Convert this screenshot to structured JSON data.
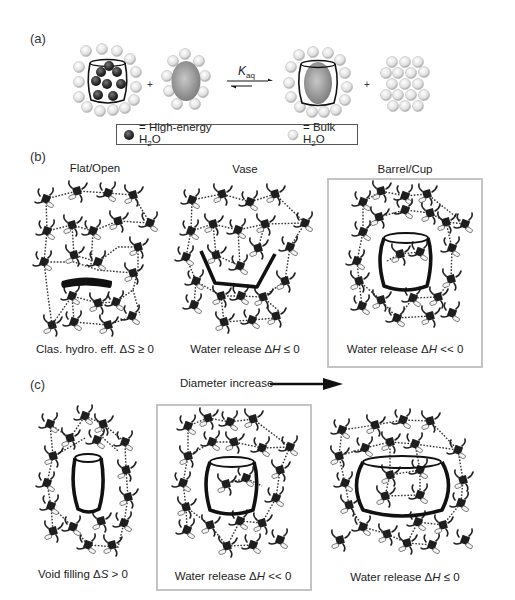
{
  "panels": {
    "a": {
      "label": "(a)",
      "equilibrium_label": "K",
      "equilibrium_sub": "aq",
      "plus_1": "+",
      "plus_2": "+",
      "legend": {
        "high_energy_prefix": "= High-energy H",
        "high_energy_sub": "2",
        "high_energy_suffix": "O",
        "bulk_prefix": "= Bulk H",
        "bulk_sub": "2",
        "bulk_suffix": "O"
      }
    },
    "b": {
      "label": "(b)",
      "items": [
        {
          "title": "Flat/Open",
          "caption_prefix": "Clas. hydro. eff. Δ",
          "caption_var": "S",
          "caption_suffix": " ≥ 0",
          "highlighted": false
        },
        {
          "title": "Vase",
          "caption_prefix": "Water release Δ",
          "caption_var": "H",
          "caption_suffix": " ≤ 0",
          "highlighted": false
        },
        {
          "title": "Barrel/Cup",
          "caption_prefix": "Water release Δ",
          "caption_var": "H",
          "caption_suffix": " << 0",
          "highlighted": true
        }
      ]
    },
    "c": {
      "label": "(c)",
      "arrow_label": "Diameter increase",
      "items": [
        {
          "caption_prefix": "Void filling Δ",
          "caption_var": "S",
          "caption_suffix": " > 0",
          "highlighted": false
        },
        {
          "caption_prefix": "Water release Δ",
          "caption_var": "H",
          "caption_suffix": " << 0",
          "highlighted": true
        },
        {
          "caption_prefix": "Water release Δ",
          "caption_var": "H",
          "caption_suffix": " ≤ 0",
          "highlighted": false
        }
      ]
    }
  },
  "colors": {
    "highlight_border": "#c4c4c4",
    "water_dark": "#2a2a2a",
    "bulk_water": "#d9d9d9",
    "guest": "#9a9a9a",
    "ink": "#111111"
  }
}
